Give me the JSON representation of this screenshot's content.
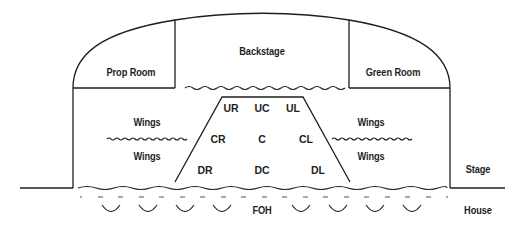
{
  "diagram": {
    "colors": {
      "line": "#1e1e1e",
      "background": "#ffffff"
    },
    "rooms": {
      "prop_room": "Prop Room",
      "backstage": "Backstage",
      "green_room": "Green Room"
    },
    "wings": {
      "left_upper": "Wings",
      "left_lower": "Wings",
      "right_upper": "Wings",
      "right_lower": "Wings"
    },
    "stage_areas": {
      "upstage_right": "UR",
      "upstage_center": "UC",
      "upstage_left": "UL",
      "center_right": "CR",
      "center": "C",
      "center_left": "CL",
      "downstage_right": "DR",
      "downstage_center": "DC",
      "downstage_left": "DL"
    },
    "zones": {
      "stage": "Stage",
      "house": "House",
      "foh": "FOH"
    }
  }
}
